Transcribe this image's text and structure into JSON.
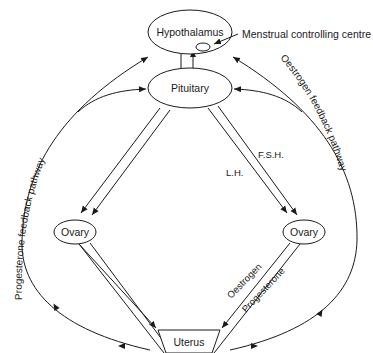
{
  "diagram": {
    "colors": {
      "ink": "#1a1a1a",
      "background": "#ffffff"
    },
    "nodes": {
      "hypothalamus": {
        "label": "Hypothalamus"
      },
      "pituitary": {
        "label": "Pituitary"
      },
      "ovary_left": {
        "label": "Ovary"
      },
      "ovary_right": {
        "label": "Ovary"
      },
      "uterus": {
        "label": "Uterus"
      }
    },
    "annotations": {
      "menstrual_centre": "Menstrual controlling centre"
    },
    "hormones": {
      "fsh": "F.S.H.",
      "lh": "L.H.",
      "oestrogen": "Oestrogen",
      "progesterone": "Progesterone"
    },
    "pathways": {
      "left": "Progesterone   feedback   pathway",
      "right": "Oestrogen   feedback   pathway"
    }
  }
}
